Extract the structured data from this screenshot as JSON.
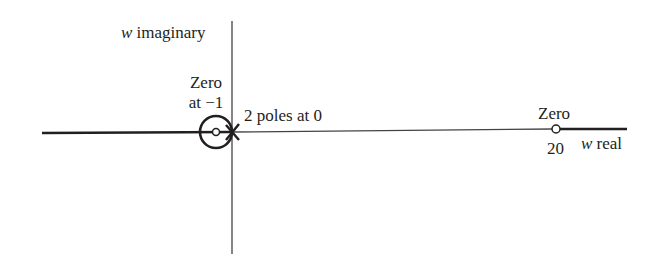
{
  "diagram": {
    "type": "root-locus",
    "axes": {
      "imaginary_label_var": "w",
      "imaginary_label_text": "imaginary",
      "real_label_var": "w",
      "real_label_text": "real"
    },
    "annotations": {
      "zero_left_line1": "Zero",
      "zero_left_line2": "at −1",
      "poles": "2 poles at 0",
      "zero_right_line1": "Zero",
      "zero_right_value": "20"
    },
    "elements": {
      "poles": [
        {
          "position": 0,
          "multiplicity": 2,
          "marker": "x"
        }
      ],
      "zeros": [
        {
          "position": -1,
          "marker": "o"
        },
        {
          "position": 20,
          "marker": "o"
        }
      ],
      "locus_segments": [
        "real axis left of 0",
        "real axis right of 20",
        "circle around -1"
      ]
    },
    "colors": {
      "ink": "#231f20",
      "thin_line": "#555555"
    }
  }
}
